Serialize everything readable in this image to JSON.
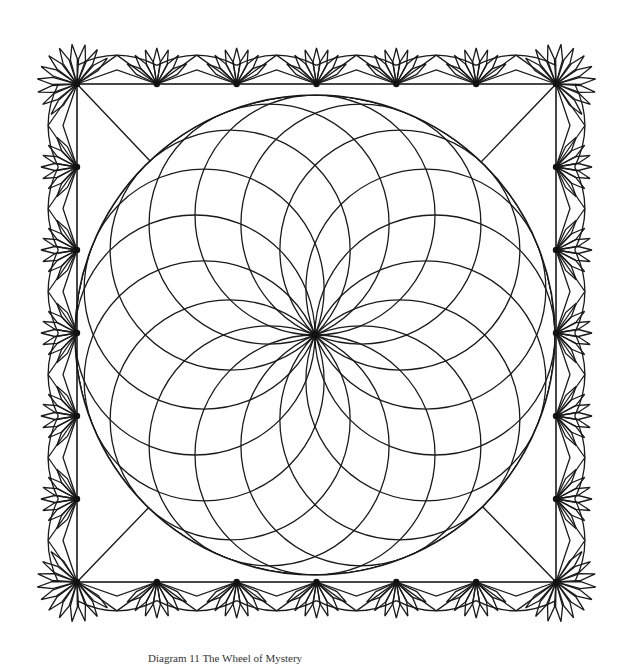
{
  "figure": {
    "caption": "Diagram 11 The Wheel of Mystery",
    "stroke_color": "#1a1a1a",
    "background": "#ffffff"
  },
  "layout": {
    "square": {
      "x1": 77,
      "y1": 84,
      "x2": 556,
      "y2": 582
    },
    "circle": {
      "cx": 315,
      "cy": 335,
      "r": 240
    },
    "rosette_arcs": 16,
    "rings": 6,
    "border_hubs_per_side": 7,
    "petals_per_fan": 7
  }
}
